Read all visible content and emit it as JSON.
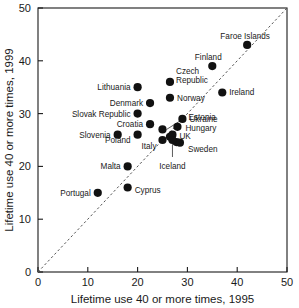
{
  "chart_data": {
    "type": "scatter",
    "title": "",
    "xlabel": "Lifetime use 40 or more times, 1995",
    "ylabel": "Lifetime use 40 or more times, 1999",
    "xlim": [
      0,
      50
    ],
    "ylim": [
      0,
      50
    ],
    "xticks": [
      0,
      10,
      20,
      30,
      40,
      50
    ],
    "yticks": [
      0,
      10,
      20,
      30,
      40,
      50
    ],
    "grid": false,
    "legend": "none",
    "annotations": [
      {
        "text": "diagonal reference line y = x",
        "style": "dashed"
      }
    ],
    "points": [
      {
        "label": "Faroe Islands",
        "x": 42,
        "y": 43,
        "label_dx": -2,
        "label_dy": -9,
        "anchor": "middle",
        "leader": false
      },
      {
        "label": "Finland",
        "x": 35,
        "y": 39,
        "label_dx": -4,
        "label_dy": -9,
        "anchor": "middle",
        "leader": false
      },
      {
        "label": "Ireland",
        "x": 37,
        "y": 34,
        "label_dx": 7,
        "label_dy": 0,
        "anchor": "start",
        "leader": false
      },
      {
        "label": "Czech Republic",
        "x": 26.5,
        "y": 36,
        "label_dx": 6,
        "label_dy": -4,
        "anchor": "start",
        "leader": false,
        "two_line": true
      },
      {
        "label": "Lithuania",
        "x": 20,
        "y": 35,
        "label_dx": -7,
        "label_dy": 0,
        "anchor": "end",
        "leader": false
      },
      {
        "label": "Norway",
        "x": 26.5,
        "y": 33,
        "label_dx": 7,
        "label_dy": 0,
        "anchor": "start",
        "leader": false
      },
      {
        "label": "Denmark",
        "x": 22.5,
        "y": 32,
        "label_dx": -7,
        "label_dy": 0,
        "anchor": "end",
        "leader": false
      },
      {
        "label": "Slovak Republic",
        "x": 20,
        "y": 30,
        "label_dx": -7,
        "label_dy": 0,
        "anchor": "end",
        "leader": false
      },
      {
        "label": "Ukraine",
        "x": 29,
        "y": 29,
        "label_dx": 7,
        "label_dy": 0,
        "anchor": "start",
        "leader": false
      },
      {
        "label": "Estonia",
        "x": 25,
        "y": 27,
        "label_dx": 26,
        "label_dy": -12,
        "anchor": "start",
        "leader": true
      },
      {
        "label": "Croatia",
        "x": 22.5,
        "y": 28,
        "label_dx": -7,
        "label_dy": 0,
        "anchor": "end",
        "leader": false
      },
      {
        "label": "Hungary",
        "x": 28,
        "y": 27.5,
        "label_dx": 8,
        "label_dy": 1,
        "anchor": "start",
        "leader": false
      },
      {
        "label": "Slovenia",
        "x": 16,
        "y": 26,
        "label_dx": -7,
        "label_dy": 0,
        "anchor": "end",
        "leader": false
      },
      {
        "label": "Poland",
        "x": 20,
        "y": 26,
        "label_dx": -7,
        "label_dy": 5,
        "anchor": "end",
        "leader": false
      },
      {
        "label": "UK",
        "x": 27,
        "y": 26,
        "label_dx": 7,
        "label_dy": 1,
        "anchor": "start",
        "leader": false
      },
      {
        "label": "Italy",
        "x": 25,
        "y": 25,
        "label_dx": -6,
        "label_dy": 6,
        "anchor": "end",
        "leader": false
      },
      {
        "label": "Sweden",
        "x": 28.5,
        "y": 24.5,
        "label_dx": 8,
        "label_dy": 6,
        "anchor": "start",
        "leader": false
      },
      {
        "label": "Iceland",
        "x": 27,
        "y": 25,
        "label_dx": 0,
        "label_dy": 26,
        "anchor": "middle",
        "leader": true
      },
      {
        "label": "Malta",
        "x": 18,
        "y": 20,
        "label_dx": -7,
        "label_dy": 0,
        "anchor": "end",
        "leader": false
      },
      {
        "label": "Cyprus",
        "x": 18,
        "y": 16,
        "label_dx": 7,
        "label_dy": 2,
        "anchor": "start",
        "leader": false
      },
      {
        "label": "Portugal",
        "x": 12,
        "y": 15,
        "label_dx": -7,
        "label_dy": 0,
        "anchor": "end",
        "leader": false
      }
    ],
    "extra_points": [
      {
        "x": 26.5,
        "y": 25.6
      },
      {
        "x": 27.8,
        "y": 24.6
      }
    ]
  },
  "axes": {
    "x_title": "Lifetime use 40 or more times, 1995",
    "y_title": "Lifetime use 40 or more times, 1999",
    "x_tick_labels": [
      "0",
      "10",
      "20",
      "30",
      "40",
      "50"
    ],
    "y_tick_labels": [
      "0",
      "10",
      "20",
      "30",
      "40",
      "50"
    ]
  },
  "colors": {
    "marker": "#111111",
    "axis": "#1a1a1a",
    "diagonal": "#555555",
    "background": "#ffffff"
  }
}
